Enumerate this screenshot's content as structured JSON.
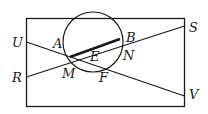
{
  "diagram": {
    "type": "geometry-figure",
    "colors": {
      "stroke": "#1a1a1a",
      "background": "#ffffff"
    },
    "labels": {
      "U": "U",
      "R": "R",
      "A": "A",
      "M": "M",
      "E": "E",
      "F": "F",
      "B": "B",
      "N": "N",
      "S": "S",
      "V": "V"
    },
    "segments": [
      {
        "from": "U",
        "to": "V"
      },
      {
        "from": "R",
        "to": "S"
      },
      {
        "from": "A",
        "to": "B",
        "style": "thick"
      }
    ]
  }
}
